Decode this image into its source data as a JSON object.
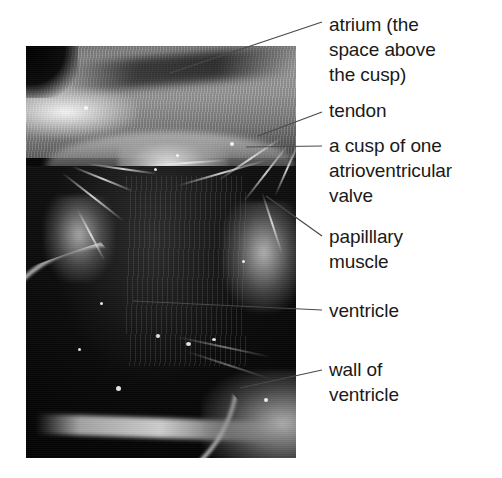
{
  "figure": {
    "background_color": "#ffffff",
    "text_color": "#1a1a1a",
    "leader_line_color": "#4a4a4a"
  },
  "photo": {
    "alt_name": "heart-dissection-photograph",
    "description": "Black and white dissection photograph showing the interior of a heart ventricle with atrium above, cusp, tendons and papillary muscles",
    "palette": "grayscale"
  },
  "labels": [
    {
      "id": "atrium",
      "text": "atrium (the\nspace above\nthe cusp)",
      "lines": [
        "atrium (the",
        "space above",
        "the cusp)"
      ]
    },
    {
      "id": "tendon",
      "text": "tendon",
      "lines": [
        "tendon"
      ]
    },
    {
      "id": "cusp",
      "text": "a cusp of one\natrioventricular\nvalve",
      "lines": [
        "a cusp of one",
        "atrioventricular",
        "valve"
      ]
    },
    {
      "id": "papillary-muscle",
      "text": "papilllary\nmuscle",
      "lines": [
        "papilllary",
        "muscle"
      ]
    },
    {
      "id": "ventricle",
      "text": "ventricle",
      "lines": [
        "ventricle"
      ]
    },
    {
      "id": "wall-of-ventricle",
      "text": "wall of\nventricle",
      "lines": [
        "wall of",
        "ventricle"
      ]
    }
  ]
}
